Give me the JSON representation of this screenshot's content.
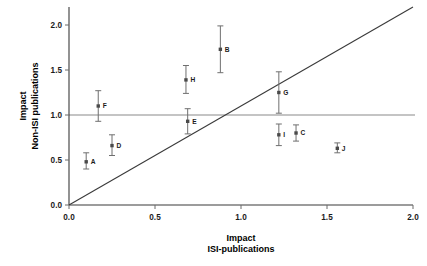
{
  "chart_data": {
    "type": "scatter",
    "title": "",
    "xlabel": "Impact ISI-publications",
    "xlabel_line1": "Impact",
    "xlabel_line2": "ISI-publications",
    "ylabel": "Impact Non-ISI publications",
    "ylabel_line1": "Impact",
    "ylabel_line2": "Non-ISI publications",
    "xlim": [
      0.0,
      2.0
    ],
    "ylim": [
      0.0,
      2.2
    ],
    "xticks": [
      "0.0",
      "0.5",
      "1.0",
      "1.5",
      "2.0"
    ],
    "xtick_values": [
      0.0,
      0.5,
      1.0,
      1.5,
      2.0
    ],
    "yticks": [
      "0.0",
      "0.5",
      "1.0",
      "1.5",
      "2.0"
    ],
    "ytick_values": [
      0.0,
      0.5,
      1.0,
      1.5,
      2.0
    ],
    "grid": false,
    "legend": "none",
    "reference_lines": [
      {
        "name": "horizontal-unity-line",
        "type": "horizontal",
        "y": 1.0,
        "color": "#8a8a8a"
      },
      {
        "name": "diagonal-identity-line",
        "type": "diagonal",
        "from": [
          0.0,
          0.0
        ],
        "to": [
          2.0,
          2.2
        ],
        "color": "#3a3a3a"
      }
    ],
    "error_bar_orientation": "vertical",
    "points": [
      {
        "label": "A",
        "x": 0.1,
        "y": 0.48,
        "y_low": 0.4,
        "y_high": 0.58,
        "label_side": "right"
      },
      {
        "label": "B",
        "x": 0.88,
        "y": 1.73,
        "y_low": 1.47,
        "y_high": 1.99,
        "label_side": "right"
      },
      {
        "label": "C",
        "x": 1.32,
        "y": 0.8,
        "y_low": 0.71,
        "y_high": 0.89,
        "label_side": "right"
      },
      {
        "label": "D",
        "x": 0.25,
        "y": 0.66,
        "y_low": 0.55,
        "y_high": 0.78,
        "label_side": "right"
      },
      {
        "label": "E",
        "x": 0.69,
        "y": 0.93,
        "y_low": 0.79,
        "y_high": 1.07,
        "label_side": "right"
      },
      {
        "label": "F",
        "x": 0.17,
        "y": 1.1,
        "y_low": 0.93,
        "y_high": 1.27,
        "label_side": "right"
      },
      {
        "label": "G",
        "x": 1.22,
        "y": 1.25,
        "y_low": 1.02,
        "y_high": 1.48,
        "label_side": "right"
      },
      {
        "label": "H",
        "x": 0.68,
        "y": 1.39,
        "y_low": 1.24,
        "y_high": 1.55,
        "label_side": "right"
      },
      {
        "label": "I",
        "x": 1.22,
        "y": 0.78,
        "y_low": 0.66,
        "y_high": 0.9,
        "label_side": "right"
      },
      {
        "label": "J",
        "x": 1.56,
        "y": 0.63,
        "y_low": 0.58,
        "y_high": 0.69,
        "label_side": "right"
      }
    ]
  },
  "colors": {
    "marker": "#4a4a4a",
    "error_bar": "#6f6f6f",
    "axis": "#3a3a3a",
    "reference_horizontal": "#8a8a8a",
    "background": "#ffffff",
    "text": "#1b1b1b"
  }
}
